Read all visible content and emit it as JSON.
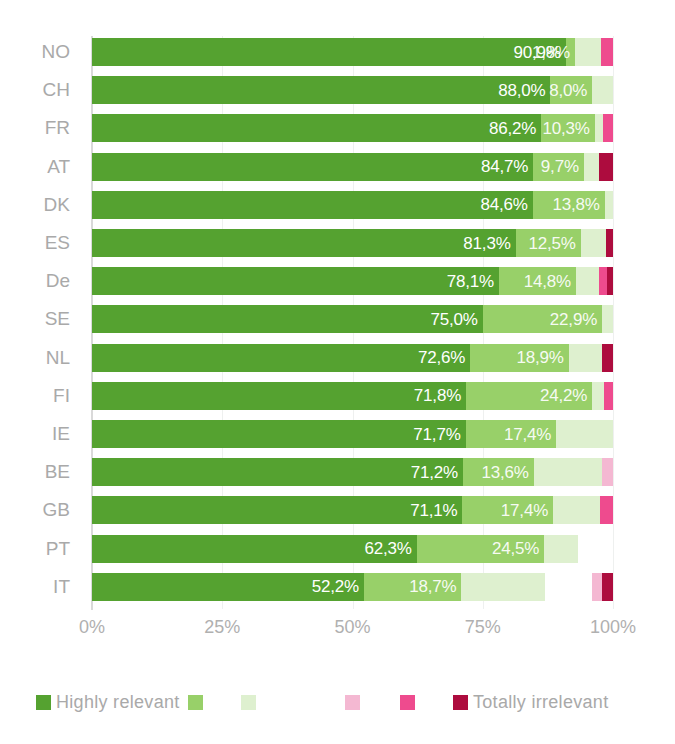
{
  "chart_data": {
    "type": "bar",
    "subtype": "stacked-horizontal-100",
    "title": "",
    "xlabel": "",
    "ylabel": "",
    "xlim": [
      0,
      100
    ],
    "xticks": [
      "0%",
      "25%",
      "50%",
      "75%",
      "100%"
    ],
    "xtick_values": [
      0,
      25,
      50,
      75,
      100
    ],
    "grid": true,
    "grid_axis": "x",
    "legend_position": "bottom",
    "categories": [
      "NO",
      "CH",
      "FR",
      "AT",
      "DK",
      "ES",
      "De",
      "SE",
      "NL",
      "FI",
      "IE",
      "BE",
      "GB",
      "PT",
      "IT"
    ],
    "series": [
      {
        "name": "Highly relevant",
        "color": "#55A230",
        "values": [
          90.9,
          88.0,
          86.2,
          84.7,
          84.6,
          81.3,
          78.1,
          75.0,
          72.6,
          71.8,
          71.7,
          71.2,
          71.1,
          62.3,
          52.2
        ]
      },
      {
        "name": "",
        "color": "#98D069",
        "values": [
          1.8,
          8.0,
          10.3,
          9.7,
          13.8,
          12.5,
          14.8,
          22.9,
          18.9,
          24.2,
          17.4,
          13.6,
          17.4,
          24.5,
          18.7
        ]
      },
      {
        "name": "",
        "color": "#DEF0CF",
        "values": [
          5.0,
          4.0,
          1.5,
          3.0,
          1.6,
          4.8,
          4.4,
          2.1,
          6.4,
          2.2,
          10.9,
          13.0,
          9.0,
          6.4,
          16.0
        ]
      },
      {
        "name": "",
        "color": "#F4B8D2",
        "values": [
          0.0,
          0.0,
          0.0,
          0.0,
          0.0,
          0.0,
          0.0,
          0.0,
          0.0,
          0.0,
          0.0,
          2.2,
          0.0,
          0.0,
          2.0
        ]
      },
      {
        "name": "",
        "color": "#EE4B8E",
        "values": [
          2.3,
          0.0,
          2.0,
          0.0,
          0.0,
          0.0,
          1.5,
          0.0,
          0.0,
          1.8,
          0.0,
          0.0,
          2.5,
          0.0,
          0.0
        ]
      },
      {
        "name": "Totally irrelevant",
        "color": "#AD0C3E",
        "values": [
          0.0,
          0.0,
          0.0,
          2.6,
          0.0,
          1.4,
          1.2,
          0.0,
          2.1,
          0.0,
          0.0,
          0.0,
          0.0,
          0.0,
          2.1
        ]
      }
    ],
    "bar_labels": {
      "series_0": [
        "90,9%",
        "88,0%",
        "86,2%",
        "84,7%",
        "84,6%",
        "81,3%",
        "78,1%",
        "75,0%",
        "72,6%",
        "71,8%",
        "71,7%",
        "71,2%",
        "71,1%",
        "62,3%",
        "52,2%"
      ],
      "series_1": [
        "1,8%",
        "8,0%",
        "10,3%",
        "9,7%",
        "13,8%",
        "12,5%",
        "14,8%",
        "22,9%",
        "18,9%",
        "24,2%",
        "17,4%",
        "13,6%",
        "17,4%",
        "24,5%",
        "18,7%"
      ]
    },
    "legend": [
      {
        "label": "Highly relevant",
        "color": "#55A230",
        "show_label": true
      },
      {
        "label": "",
        "color": "#98D069",
        "show_label": false
      },
      {
        "label": "",
        "color": "#DEF0CF",
        "show_label": false
      },
      {
        "label": "",
        "color": "#F4B8D2",
        "show_label": false
      },
      {
        "label": "",
        "color": "#EE4B8E",
        "show_label": false
      },
      {
        "label": "Totally irrelevant",
        "color": "#AD0C3E",
        "show_label": true
      }
    ]
  },
  "axis": {
    "tick_0": "0%",
    "tick_1": "25%",
    "tick_2": "50%",
    "tick_3": "75%",
    "tick_4": "100%"
  },
  "legend_labels": {
    "first": "Highly relevant",
    "last": "Totally irrelevant"
  },
  "colors": {
    "highly_relevant": "#55A230",
    "mid_green": "#98D069",
    "light_green": "#DEF0CF",
    "light_pink": "#F4B8D2",
    "pink": "#EE4B8E",
    "totally_irrelevant": "#AD0C3E",
    "gridline": "#EEF0EF",
    "axis": "#D9D9D9",
    "tick_text": "#A9A9A9"
  }
}
